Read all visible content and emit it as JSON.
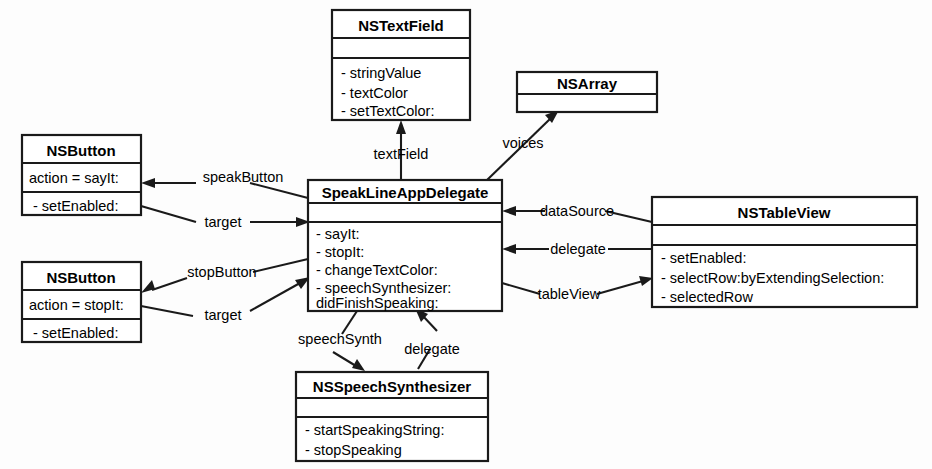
{
  "diagram": {
    "type": "uml-class-diagram",
    "background_color": "#fdfdfd",
    "line_color": "#1a1a1a",
    "classes": [
      {
        "id": "nstextfield",
        "name": "NSTextField",
        "attributes": [],
        "methods": [
          "- stringValue",
          "- textColor",
          "- setTextColor:"
        ]
      },
      {
        "id": "nsarray",
        "name": "NSArray",
        "attributes": [],
        "methods": []
      },
      {
        "id": "nsbutton_say",
        "name": "NSButton",
        "attributes": [
          "action = sayIt:"
        ],
        "methods": [
          "- setEnabled:"
        ]
      },
      {
        "id": "nsbutton_stop",
        "name": "NSButton",
        "attributes": [
          "action = stopIt:"
        ],
        "methods": [
          "- setEnabled:"
        ]
      },
      {
        "id": "delegate",
        "name": "SpeakLineAppDelegate",
        "attributes": [],
        "methods": [
          "- sayIt:",
          "- stopIt:",
          "- changeTextColor:",
          "- speechSynthesizer:",
          "   didFinishSpeaking:"
        ]
      },
      {
        "id": "nstableview",
        "name": "NSTableView",
        "attributes": [],
        "methods": [
          "- setEnabled:",
          "- selectRow:byExtendingSelection:",
          "- selectedRow"
        ]
      },
      {
        "id": "nsspeechsynthesizer",
        "name": "NSSpeechSynthesizer",
        "attributes": [],
        "methods": [
          "- startSpeakingString:",
          "- stopSpeaking"
        ]
      }
    ],
    "connections": [
      {
        "id": "textField",
        "label": "textField",
        "from": "delegate",
        "to": "nstextfield"
      },
      {
        "id": "voices",
        "label": "voices",
        "from": "delegate",
        "to": "nsarray"
      },
      {
        "id": "speakButton",
        "label": "speakButton",
        "from": "delegate",
        "to": "nsbutton_say"
      },
      {
        "id": "target_say",
        "label": "target",
        "from": "nsbutton_say",
        "to": "delegate"
      },
      {
        "id": "stopButton",
        "label": "stopButton",
        "from": "delegate",
        "to": "nsbutton_stop"
      },
      {
        "id": "target_stop",
        "label": "target",
        "from": "nsbutton_stop",
        "to": "delegate"
      },
      {
        "id": "dataSource",
        "label": "dataSource",
        "from": "nstableview",
        "to": "delegate"
      },
      {
        "id": "delegate_tv",
        "label": "delegate",
        "from": "nstableview",
        "to": "delegate"
      },
      {
        "id": "tableView",
        "label": "tableView",
        "from": "delegate",
        "to": "nstableview"
      },
      {
        "id": "speechSynth",
        "label": "speechSynth",
        "from": "delegate",
        "to": "nsspeechsynthesizer"
      },
      {
        "id": "delegate_ss",
        "label": "delegate",
        "from": "nsspeechsynthesizer",
        "to": "delegate"
      }
    ]
  }
}
